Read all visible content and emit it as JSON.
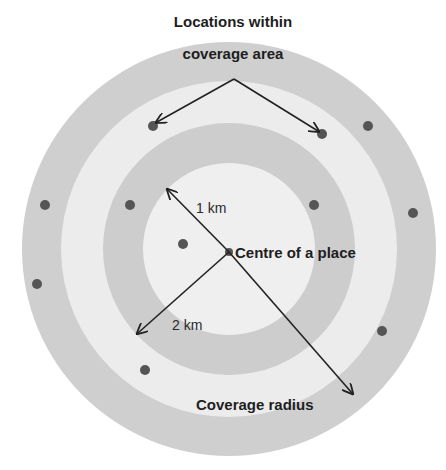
{
  "title": {
    "line1": "Locations within",
    "line2": "coverage area"
  },
  "labels": {
    "centre": "Centre of a place",
    "one_km": "1 km",
    "two_km": "2 km",
    "coverage_radius": "Coverage radius"
  },
  "colors": {
    "outer_ring": "#cfcfcf",
    "light_ring": "#ececec",
    "mid_ring": "#cdcdcd",
    "inner_disc": "#efefef",
    "dot": "#555555",
    "arrow": "#222222",
    "text": "#1e1e1e"
  },
  "geometry": {
    "center": [
      229,
      249
    ],
    "ring_radii": [
      207,
      168,
      126,
      86
    ]
  },
  "locations": [
    {
      "x": 153,
      "y": 126
    },
    {
      "x": 322,
      "y": 134
    },
    {
      "x": 368,
      "y": 126
    },
    {
      "x": 45,
      "y": 205
    },
    {
      "x": 130,
      "y": 205
    },
    {
      "x": 314,
      "y": 205
    },
    {
      "x": 413,
      "y": 213
    },
    {
      "x": 183,
      "y": 244
    },
    {
      "x": 37,
      "y": 284
    },
    {
      "x": 382,
      "y": 331
    },
    {
      "x": 145,
      "y": 370
    }
  ]
}
